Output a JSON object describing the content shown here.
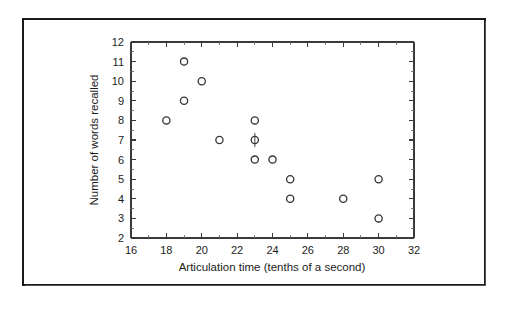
{
  "chart_data": {
    "type": "scatter",
    "title": "",
    "xlabel": "Articulation time (tenths of a second)",
    "ylabel": "Number of words recalled",
    "xlim": [
      16,
      32
    ],
    "ylim": [
      2,
      12
    ],
    "grid": false,
    "legend": null,
    "x_tick_labels": [
      "16",
      "18",
      "20",
      "22",
      "24",
      "26",
      "28",
      "30",
      "32"
    ],
    "x_tick_values": [
      16,
      18,
      20,
      22,
      24,
      26,
      28,
      30,
      32
    ],
    "x_minor_ticks": [
      17,
      19,
      21,
      23,
      25,
      27,
      29,
      31
    ],
    "y_tick_labels": [
      "2",
      "3",
      "4",
      "5",
      "6",
      "7",
      "8",
      "9",
      "10",
      "11",
      "12"
    ],
    "y_tick_values": [
      2,
      3,
      4,
      5,
      6,
      7,
      8,
      9,
      10,
      11,
      12
    ],
    "marker": "open-circle",
    "marker_color": "#333333",
    "points": [
      {
        "x": 18,
        "y": 8
      },
      {
        "x": 19,
        "y": 11
      },
      {
        "x": 19,
        "y": 9
      },
      {
        "x": 20,
        "y": 10
      },
      {
        "x": 21,
        "y": 7
      },
      {
        "x": 23,
        "y": 8
      },
      {
        "x": 23,
        "y": 7,
        "overlapping": true
      },
      {
        "x": 23,
        "y": 6
      },
      {
        "x": 24,
        "y": 6
      },
      {
        "x": 25,
        "y": 5
      },
      {
        "x": 25,
        "y": 4
      },
      {
        "x": 28,
        "y": 4
      },
      {
        "x": 30,
        "y": 5
      },
      {
        "x": 30,
        "y": 3
      }
    ],
    "n_points": 14
  },
  "figure": {
    "background": "#ffffff",
    "frame_color": "#1a1a1a",
    "axis_color": "#3a3a3a"
  }
}
